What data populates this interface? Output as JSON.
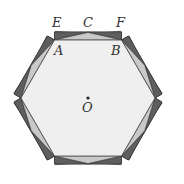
{
  "figure": {
    "center": {
      "label": "O",
      "x": 88,
      "y": 98
    },
    "inner_hexagon": {
      "apothem": 58,
      "side": 67,
      "fill": "#efefef",
      "stroke": "#444444"
    },
    "side_rectangle": {
      "height": 8,
      "fill": "#8c8c8c",
      "light_triangle_fill": "#c9c9c9",
      "dark_triangle_fill": "#5e5e5e"
    },
    "labels": {
      "E": "E",
      "C": "C",
      "F": "F",
      "A": "A",
      "B": "B",
      "O": "O"
    },
    "rotations_deg": [
      0,
      60,
      120,
      180,
      240,
      300
    ]
  }
}
